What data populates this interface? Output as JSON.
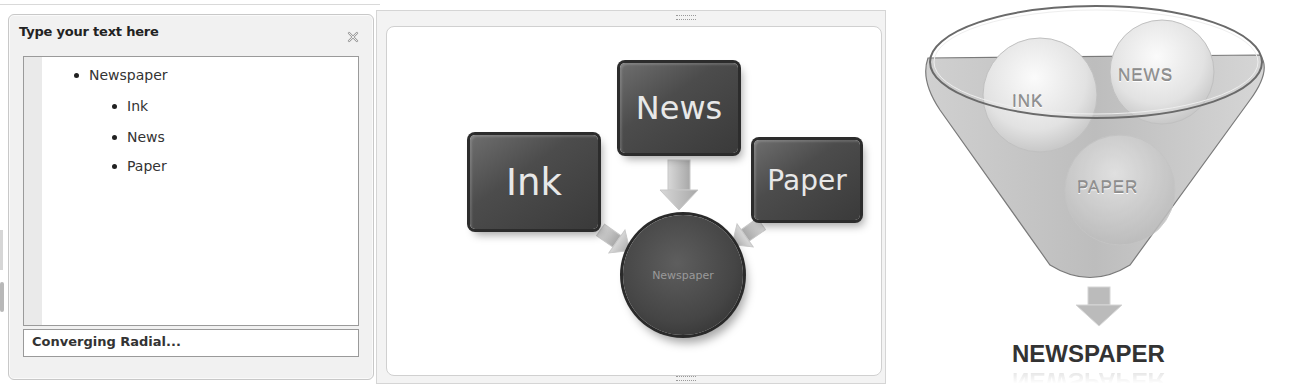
{
  "text_pane": {
    "title": "Type your text here",
    "close_icon": "close-icon",
    "items": [
      {
        "label": "Newspaper",
        "level": 1
      },
      {
        "label": "Ink",
        "level": 2
      },
      {
        "label": "News",
        "level": 2
      },
      {
        "label": "Paper",
        "level": 2
      }
    ],
    "layout_name": "Converging Radial..."
  },
  "smartart": {
    "layout": "Converging Radial",
    "center": "Newspaper",
    "inputs": [
      "Ink",
      "News",
      "Paper"
    ],
    "colors": {
      "box_fill": "#4a4a4a",
      "box_text": "#e8e8e8",
      "arrow": "#b5b5b5"
    }
  },
  "funnel": {
    "balls": [
      "INK",
      "NEWS",
      "PAPER"
    ],
    "output": "NEWSPAPER"
  }
}
